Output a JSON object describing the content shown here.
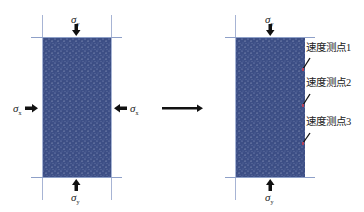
{
  "diagram": {
    "left_panel": {
      "description": "biaxially loaded specimen",
      "loads": {
        "top": {
          "symbol": "σ",
          "subscript": "y",
          "direction": "down"
        },
        "bottom": {
          "symbol": "σ",
          "subscript": "y",
          "direction": "up"
        },
        "left": {
          "symbol": "σ",
          "subscript": "x",
          "direction": "right"
        },
        "right": {
          "symbol": "σ",
          "subscript": "x",
          "direction": "left"
        }
      }
    },
    "transition_arrow": {
      "direction": "right"
    },
    "right_panel": {
      "description": "uniaxially loaded specimen with velocity measurement points",
      "loads": {
        "top": {
          "symbol": "σ",
          "subscript": "y",
          "direction": "down"
        },
        "bottom": {
          "symbol": "σ",
          "subscript": "y",
          "direction": "up"
        }
      },
      "probes": [
        {
          "label": "速度测点1"
        },
        {
          "label": "速度测点2"
        },
        {
          "label": "速度测点3"
        }
      ]
    },
    "colors": {
      "specimen": "#3d4f86",
      "boundary_lines": "#8ea0c8",
      "arrows": "#111111",
      "probe_marker": "#b0405a"
    }
  }
}
